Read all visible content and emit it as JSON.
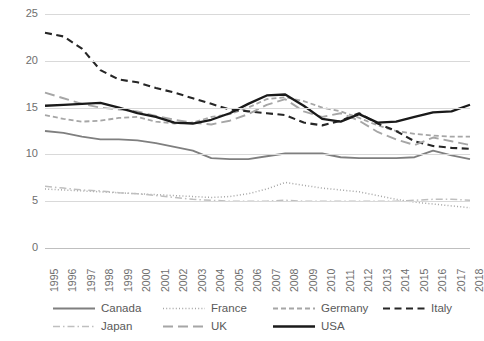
{
  "chart_data": {
    "type": "line",
    "title": "",
    "xlabel": "",
    "ylabel": "",
    "ylim": [
      0,
      25
    ],
    "yticks": [
      0,
      5,
      10,
      15,
      20,
      25
    ],
    "grid": true,
    "legend_position": "bottom",
    "x": [
      1995,
      1996,
      1997,
      1998,
      1999,
      2000,
      2001,
      2002,
      2003,
      2004,
      2005,
      2006,
      2007,
      2008,
      2009,
      2010,
      2011,
      2012,
      2013,
      2014,
      2015,
      2016,
      2017,
      2018
    ],
    "categories": [
      "1995",
      "1996",
      "1997",
      "1998",
      "1999",
      "2000",
      "2001",
      "2002",
      "2003",
      "2004",
      "2005",
      "2006",
      "2007",
      "2008",
      "2009",
      "2010",
      "2011",
      "2012",
      "2013",
      "2014",
      "2015",
      "2016",
      "2017",
      "2018"
    ],
    "series": [
      {
        "name": "Canada",
        "color": "#7f7f7f",
        "dash": "none",
        "width": 1.9,
        "values": [
          12.5,
          12.3,
          11.9,
          11.6,
          11.6,
          11.5,
          11.2,
          10.8,
          10.4,
          9.6,
          9.5,
          9.5,
          9.8,
          10.1,
          10.1,
          10.1,
          9.7,
          9.6,
          9.6,
          9.6,
          9.7,
          10.4,
          9.9,
          9.5
        ]
      },
      {
        "name": "France",
        "color": "#a6a6a6",
        "dash": "dotted",
        "width": 1.5,
        "values": [
          6.3,
          6.2,
          6.1,
          6.0,
          5.9,
          5.8,
          5.7,
          5.6,
          5.5,
          5.4,
          5.5,
          5.8,
          6.3,
          7.0,
          6.7,
          6.4,
          6.2,
          6.0,
          5.6,
          5.2,
          4.9,
          4.7,
          4.5,
          4.3
        ]
      },
      {
        "name": "Germany",
        "color": "#a6a6a6",
        "dash": "dashed",
        "width": 1.8,
        "values": [
          14.2,
          13.8,
          13.5,
          13.6,
          13.9,
          14.0,
          13.5,
          13.3,
          13.4,
          14.0,
          14.3,
          15.0,
          15.9,
          16.1,
          15.7,
          15.0,
          14.6,
          13.9,
          13.1,
          12.5,
          12.2,
          12.0,
          11.9,
          11.9
        ]
      },
      {
        "name": "Italy",
        "color": "#262626",
        "dash": "dashed-bold",
        "width": 2.1,
        "values": [
          23.0,
          22.6,
          21.3,
          19.0,
          18.0,
          17.7,
          17.1,
          16.6,
          16.0,
          15.4,
          14.8,
          14.6,
          14.4,
          14.2,
          13.4,
          13.1,
          13.6,
          14.4,
          13.3,
          12.5,
          11.4,
          10.9,
          10.7,
          10.6
        ]
      },
      {
        "name": "Japan",
        "color": "#bfbfbf",
        "dash": "dashdot",
        "width": 1.5,
        "values": [
          6.6,
          6.4,
          6.2,
          6.1,
          5.9,
          5.8,
          5.6,
          5.4,
          5.2,
          5.1,
          5.0,
          5.0,
          5.0,
          5.1,
          5.0,
          5.0,
          5.0,
          5.0,
          5.0,
          5.0,
          5.1,
          5.2,
          5.2,
          5.1
        ]
      },
      {
        "name": "UK",
        "color": "#a6a6a6",
        "dash": "longdash",
        "width": 1.9,
        "values": [
          16.6,
          16.0,
          15.4,
          15.0,
          14.8,
          14.6,
          14.1,
          13.7,
          13.4,
          13.2,
          13.6,
          14.3,
          15.3,
          15.9,
          14.6,
          14.0,
          14.4,
          13.6,
          12.4,
          11.6,
          11.0,
          11.8,
          11.4,
          11.0
        ]
      },
      {
        "name": "USA",
        "color": "#1a1a1a",
        "dash": "none",
        "width": 2.3,
        "values": [
          15.2,
          15.3,
          15.4,
          15.5,
          15.0,
          14.4,
          14.0,
          13.4,
          13.3,
          13.7,
          14.4,
          15.4,
          16.3,
          16.4,
          15.2,
          13.8,
          13.5,
          14.3,
          13.4,
          13.5,
          14.0,
          14.5,
          14.6,
          15.3
        ]
      }
    ]
  },
  "axes": {
    "y_ticks": [
      "0",
      "5",
      "10",
      "15",
      "20",
      "25"
    ],
    "x_ticks": [
      "1995",
      "1996",
      "1997",
      "1998",
      "1999",
      "2000",
      "2001",
      "2002",
      "2003",
      "2004",
      "2005",
      "2006",
      "2007",
      "2008",
      "2009",
      "2010",
      "2011",
      "2012",
      "2013",
      "2014",
      "2015",
      "2016",
      "2017",
      "2018"
    ]
  },
  "legend": {
    "items": [
      {
        "label": "Canada",
        "color": "#7f7f7f",
        "dash": "none"
      },
      {
        "label": "France",
        "color": "#a6a6a6",
        "dash": "dotted"
      },
      {
        "label": "Germany",
        "color": "#a6a6a6",
        "dash": "dashed"
      },
      {
        "label": "Italy",
        "color": "#262626",
        "dash": "dashed-bold"
      },
      {
        "label": "Japan",
        "color": "#bfbfbf",
        "dash": "dashdot"
      },
      {
        "label": "UK",
        "color": "#a6a6a6",
        "dash": "longdash"
      },
      {
        "label": "USA",
        "color": "#1a1a1a",
        "dash": "none"
      }
    ]
  }
}
